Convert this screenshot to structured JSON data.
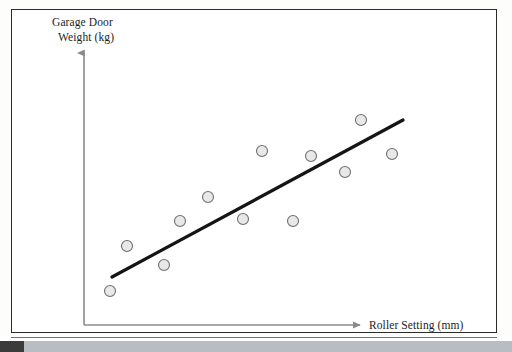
{
  "figure": {
    "name": "garage-door-scatter",
    "background_color": "#ffffff",
    "frame_color": "#2b2b2b",
    "green_rule_color": "#6a7a4a"
  },
  "axes": {
    "y_label_line1": "Garage Door",
    "y_label_line2": "Weight (kg)",
    "x_label": "Roller Setting (mm)",
    "axis_color": "#8a8a8a",
    "origin_px": [
      84,
      325
    ],
    "y_top_px": [
      84,
      50
    ],
    "x_right_px": [
      363,
      325
    ]
  },
  "chart_data": {
    "type": "scatter",
    "title": "",
    "subtitle": "",
    "xlabel": "Roller Setting (mm)",
    "ylabel": "Garage Door Weight (kg)",
    "grid": false,
    "legend": "none",
    "axis_ticks": [],
    "xlim": [
      0,
      100
    ],
    "ylim": [
      0,
      100
    ],
    "marker": {
      "shape": "circle",
      "fill_color": "#e8e8e8",
      "edge_color": "#6f6f6f",
      "diameter_px": 11
    },
    "points_px": [
      [
        110,
        291
      ],
      [
        127,
        246
      ],
      [
        164,
        265
      ],
      [
        180,
        221
      ],
      [
        208,
        197
      ],
      [
        243,
        219
      ],
      [
        262,
        151
      ],
      [
        293,
        221
      ],
      [
        311,
        156
      ],
      [
        345,
        172
      ],
      [
        361,
        120
      ],
      [
        392,
        154
      ]
    ],
    "points": [
      {
        "x": 10,
        "y": 13
      },
      {
        "x": 16,
        "y": 31
      },
      {
        "x": 29,
        "y": 23
      },
      {
        "x": 34,
        "y": 41
      },
      {
        "x": 44,
        "y": 50
      },
      {
        "x": 57,
        "y": 42
      },
      {
        "x": 64,
        "y": 69
      },
      {
        "x": 75,
        "y": 42
      },
      {
        "x": 81,
        "y": 68
      },
      {
        "x": 94,
        "y": 62
      },
      {
        "x": 99,
        "y": 82
      },
      {
        "x": 110,
        "y": 69
      }
    ],
    "trend_line": {
      "type": "linear-fit",
      "color": "#151515",
      "width_px": 3.2,
      "start_px": [
        112,
        277
      ],
      "end_px": [
        403,
        120
      ],
      "start": {
        "x": 11,
        "y": 19
      },
      "end": {
        "x": 114,
        "y": 82
      }
    }
  }
}
